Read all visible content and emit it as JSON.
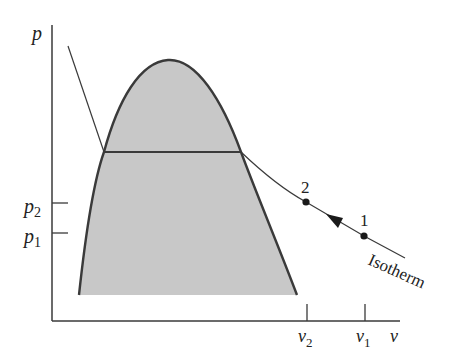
{
  "diagram": {
    "type": "p-v diagram with saturation dome and isotherm",
    "axes": {
      "y_label": "p",
      "x_label": "v",
      "y_ticks": [
        {
          "label": "p",
          "sub": "2"
        },
        {
          "label": "p",
          "sub": "1"
        }
      ],
      "x_ticks": [
        {
          "label": "v",
          "sub": "2"
        },
        {
          "label": "v",
          "sub": "1"
        }
      ]
    },
    "points": [
      {
        "label": "2"
      },
      {
        "label": "1"
      }
    ],
    "curve_label": "Isotherm",
    "colors": {
      "line": "#3a3a3a",
      "dome_fill": "#c8c8c8",
      "background": "#ffffff"
    }
  }
}
